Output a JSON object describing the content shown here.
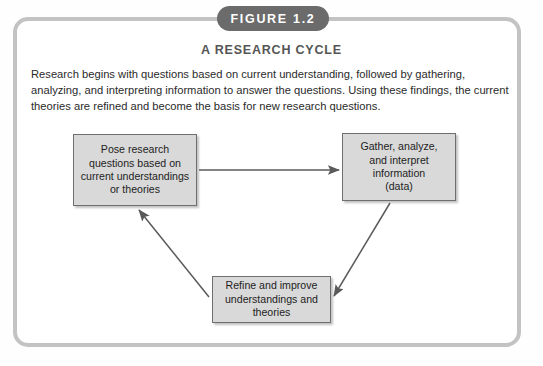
{
  "figure": {
    "badge_label": "FIGURE 1.2",
    "title": "A RESEARCH CYCLE",
    "caption": "Research begins with questions based on current understanding, followed by gathering, analyzing, and interpreting information to answer the questions. Using these findings, the current theories are refined and become the basis for new research questions.",
    "frame_color": "#c3c3c3",
    "badge_color": "#6b6b6b",
    "box_fill": "#d9d9d9",
    "box_border": "#6f6f6f",
    "arrow_color": "#5a5a5a"
  },
  "diagram": {
    "type": "cycle",
    "boxes": [
      {
        "id": "pose",
        "lines": [
          "Pose research",
          "questions based on",
          "current understandings",
          "or theories"
        ]
      },
      {
        "id": "gather",
        "lines": [
          "Gather, analyze,",
          "and interpret",
          "information",
          "(data)"
        ]
      },
      {
        "id": "refine",
        "lines": [
          "Refine and improve",
          "understandings and",
          "theories"
        ]
      }
    ],
    "arrows": [
      {
        "from": "pose",
        "to": "gather",
        "direction": "right"
      },
      {
        "from": "gather",
        "to": "refine",
        "direction": "down-left"
      },
      {
        "from": "refine",
        "to": "pose",
        "direction": "up-left"
      }
    ]
  }
}
